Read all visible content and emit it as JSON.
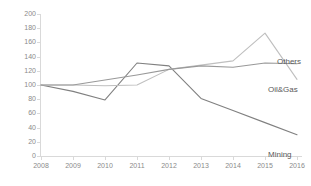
{
  "chart_data": {
    "type": "line",
    "title": "",
    "xlabel": "",
    "ylabel": "",
    "categories": [
      "2008",
      "2009",
      "2010",
      "2011",
      "2012",
      "2013",
      "2014",
      "2015",
      "2016"
    ],
    "x": [
      2008,
      2009,
      2010,
      2011,
      2012,
      2013,
      2014,
      2015,
      2016
    ],
    "ylim": [
      0,
      200
    ],
    "ytick_step": 20,
    "yticks": [
      0,
      20,
      40,
      60,
      80,
      100,
      120,
      140,
      160,
      180,
      200
    ],
    "grid": false,
    "legend_position": "end-of-line-labels",
    "series": [
      {
        "name": "Mining",
        "color": "#808080",
        "values": [
          100,
          91,
          79,
          131,
          127,
          81,
          64,
          47,
          30
        ],
        "end_label": "Mining"
      },
      {
        "name": "Oil&Gas",
        "color": "#bfbfbf",
        "values": [
          100,
          100,
          99,
          100,
          122,
          128,
          134,
          173,
          108
        ],
        "end_label": "Oil&Gas"
      },
      {
        "name": "Others",
        "color": "#999999",
        "values": [
          100,
          100,
          107,
          114,
          122,
          127,
          125,
          131,
          130
        ],
        "end_label": "Others"
      }
    ]
  },
  "labels": {
    "others": "Others",
    "oil_and_gas": "Oil&Gas",
    "mining": "Mining"
  },
  "colors": {
    "axis": "#d9d9d9",
    "tick_text": "#8a8a8a",
    "label_text": "#595959",
    "background": "#ffffff"
  }
}
